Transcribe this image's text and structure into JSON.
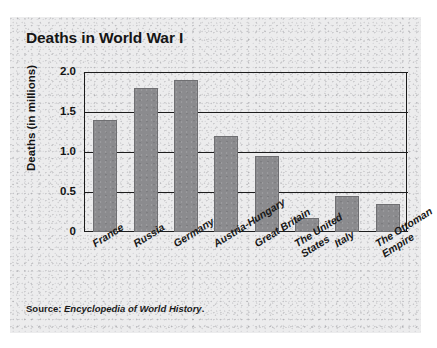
{
  "chart_data": {
    "type": "bar",
    "title": "Deaths in World War I",
    "xlabel": "",
    "ylabel": "Deaths (in millions)",
    "categories": [
      "France",
      "Russia",
      "Germany",
      "Austria-Hungary",
      "Great Britain",
      "The United\nStates",
      "Italy",
      "The Ottoman\nEmpire"
    ],
    "values": [
      1.4,
      1.8,
      1.9,
      1.2,
      0.95,
      0.17,
      0.45,
      0.35
    ],
    "ylim": [
      0,
      2.0
    ],
    "yticks": [
      0,
      0.5,
      1.0,
      1.5,
      2.0
    ],
    "ytick_labels": [
      "0",
      "0.5",
      "1.0",
      "1.5",
      "2.0"
    ],
    "grid": true,
    "legend": false,
    "bar_color": "#8b8b8e",
    "axis_color": "#1a1a1a"
  },
  "source": {
    "prefix": "Source: ",
    "title": "Encyclopedia of World History",
    "suffix": "."
  }
}
